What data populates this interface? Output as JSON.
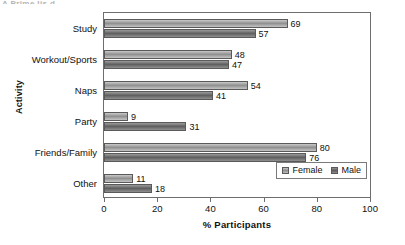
{
  "figure": {
    "clipped_title_remnant": "A Prime lis d",
    "y_axis_title": "Activity",
    "x_axis_title": "% Participants"
  },
  "legend": {
    "entries": [
      {
        "label": "Female",
        "swatch": "light-gray-swatch-icon",
        "color": "#a9a9a9"
      },
      {
        "label": "Male",
        "swatch": "dark-gray-swatch-icon",
        "color": "#6e6e6e"
      }
    ]
  },
  "chart_data": {
    "type": "bar",
    "orientation": "horizontal",
    "title": "",
    "xlabel": "% Participants",
    "ylabel": "Activity",
    "xlim": [
      0,
      100
    ],
    "xticks": [
      0,
      20,
      40,
      60,
      80,
      100
    ],
    "grid": false,
    "legend_position": "inside-bottom-right",
    "categories": [
      "Study",
      "Workout/Sports",
      "Naps",
      "Party",
      "Friends/Family",
      "Other"
    ],
    "series": [
      {
        "name": "Female",
        "color": "#a9a9a9",
        "values": [
          69,
          48,
          54,
          9,
          80,
          11
        ]
      },
      {
        "name": "Male",
        "color": "#6e6e6e",
        "values": [
          57,
          47,
          41,
          31,
          76,
          18
        ]
      }
    ]
  }
}
